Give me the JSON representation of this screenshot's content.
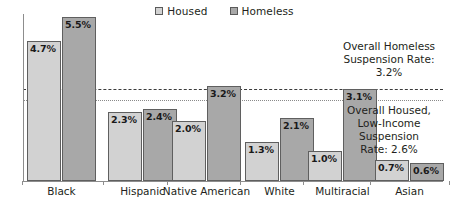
{
  "chart_data": {
    "type": "bar",
    "title": "",
    "xlabel": "",
    "ylabel": "",
    "ylim": [
      0,
      5.6
    ],
    "grid": false,
    "legend_position": "top-center",
    "categories": [
      "Black",
      "Hispanic",
      "Native American",
      "White",
      "Multiracial",
      "Asian"
    ],
    "series": [
      {
        "name": "Housed",
        "color": "#d2d2d2",
        "values": [
          4.7,
          2.3,
          2.0,
          1.3,
          1.0,
          0.7
        ],
        "labels": [
          "4.7%",
          "2.3%",
          "2.0%",
          "1.3%",
          "1.0%",
          "0.7%"
        ]
      },
      {
        "name": "Homeless",
        "color": "#a8a8a8",
        "values": [
          5.5,
          2.4,
          3.2,
          2.1,
          3.1,
          0.6
        ],
        "labels": [
          "5.5%",
          "2.4%",
          "3.2%",
          "2.1%",
          "3.1%",
          "0.6%"
        ]
      }
    ],
    "reference_lines": [
      {
        "name": "overall-homeless-rate",
        "value": 3.2,
        "style": "dashed",
        "color": "#3b3b3b",
        "annotation": "Overall Homeless Suspension Rate: 3.2%"
      },
      {
        "name": "overall-housed-low-income-rate",
        "value": 2.6,
        "style": "dotted",
        "color": "#8a8a8a",
        "annotation": "Overall Housed, Low-Income Suspension Rate: 2.6%"
      }
    ]
  },
  "legend": {
    "items": [
      {
        "label": "Housed",
        "swatch": "housed"
      },
      {
        "label": "Homeless",
        "swatch": "homeless"
      }
    ]
  },
  "annotations": {
    "homeless_note": {
      "line1": "Overall Homeless",
      "line2": "Suspension Rate:",
      "line3": "3.2%"
    },
    "housed_note": {
      "line1": "Overall Housed,",
      "line2": "Low-Income",
      "line3": "Suspension",
      "line4": "Rate: 2.6%"
    }
  },
  "axis": {
    "categories": [
      "Black",
      "Hispanic",
      "Native American",
      "White",
      "Multiracial",
      "Asian"
    ]
  },
  "colors": {
    "housed_fill": "#d2d2d2",
    "homeless_fill": "#a8a8a8",
    "bar_border": "#5f5f5f",
    "axis": "#8d8d8d",
    "text": "#231f20"
  }
}
